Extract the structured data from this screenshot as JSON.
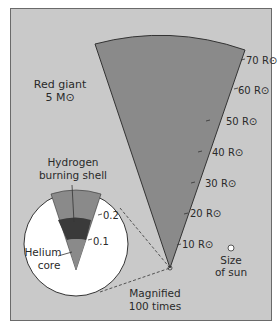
{
  "title": {
    "line1": "Red giant",
    "line2": "5 M⊙"
  },
  "scale": {
    "unit": "R⊙",
    "ticks": [
      {
        "value": 10,
        "label": "10 R⊙"
      },
      {
        "value": 20,
        "label": "20 R⊙"
      },
      {
        "value": 30,
        "label": "30 R⊙"
      },
      {
        "value": 40,
        "label": "40 R⊙"
      },
      {
        "value": 50,
        "label": "50 R⊙"
      },
      {
        "value": 60,
        "label": "60 R⊙"
      },
      {
        "value": 70,
        "label": "70 R⊙"
      }
    ]
  },
  "inset": {
    "shell_label_line1": "Hydrogen",
    "shell_label_line2": "burning shell",
    "core_label_line1": "Helium",
    "core_label_line2": "core",
    "ticks": [
      {
        "value": 0.2,
        "label": "0.2"
      },
      {
        "value": 0.1,
        "label": "0.1"
      }
    ],
    "magnified_line1": "Magnified",
    "magnified_line2": "100 times"
  },
  "sun": {
    "line1": "Size",
    "line2": "of sun"
  },
  "colors": {
    "background": "#c9c9c9",
    "envelope": "#8a8a8a",
    "shell": "#3a3a3a",
    "core": "#8a8a8a",
    "inset_fill": "#ffffff",
    "line": "#333333"
  }
}
